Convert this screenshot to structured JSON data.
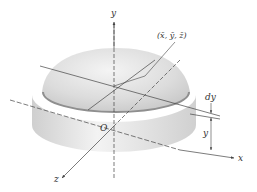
{
  "figure": {
    "type": "hemisphere-centroid",
    "labels": {
      "y_axis": "y",
      "x_axis": "x",
      "z_axis": "z",
      "origin": "O",
      "centroid": "(x̄, ȳ, z̄)",
      "slice_thickness": "dy",
      "slice_height": "y"
    },
    "colors": {
      "surface_light": "#f2f2f2",
      "surface_dark": "#c8c8c8",
      "rim": "#9a9a9a",
      "axis": "#444444"
    }
  }
}
